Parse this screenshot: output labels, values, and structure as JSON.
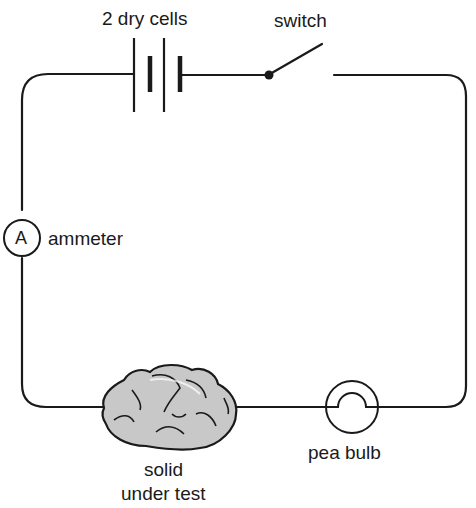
{
  "diagram": {
    "type": "electric circuit",
    "labels": {
      "cells": "2 dry cells",
      "switch": "switch",
      "ammeter": "ammeter",
      "ammeter_symbol": "A",
      "solid_line1": "solid",
      "solid_line2": "under test",
      "bulb": "pea bulb"
    },
    "components": [
      "2 dry cells",
      "switch",
      "ammeter",
      "solid under test",
      "pea bulb"
    ],
    "colors": {
      "line": "#1a1a1a",
      "rock_fill": "#c8c8c8",
      "rock_shadow": "#a8a8a8"
    }
  }
}
